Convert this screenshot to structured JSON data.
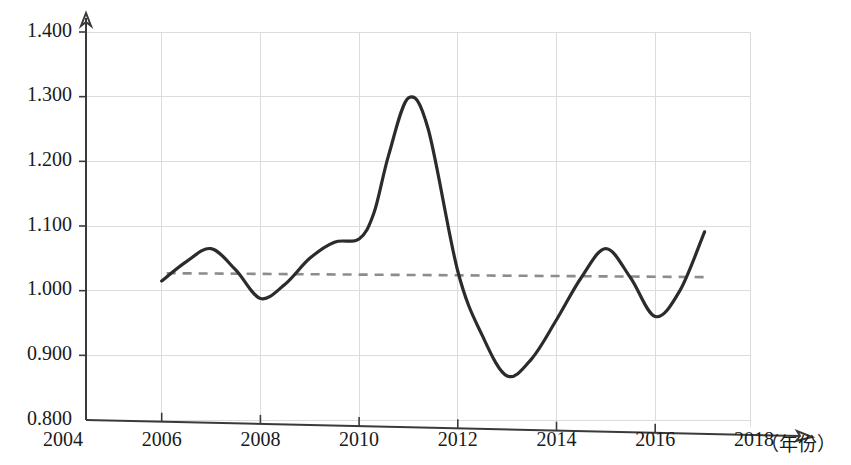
{
  "chart_data": {
    "type": "line",
    "title": "",
    "subtitle": "",
    "xlabel": "（年份）",
    "ylabel": "",
    "xlim": [
      2004,
      2018
    ],
    "ylim": [
      0.8,
      1.4
    ],
    "grid": true,
    "legend": "none",
    "x_tick_labels": [
      "2004",
      "2006",
      "2008",
      "2010",
      "2012",
      "2014",
      "2016",
      "2018"
    ],
    "x_tick_values": [
      2004,
      2006,
      2008,
      2010,
      2012,
      2014,
      2016,
      2018
    ],
    "y_tick_labels": [
      "0.800",
      "0.900",
      "1.000",
      "1.100",
      "1.200",
      "1.300",
      "1.400"
    ],
    "y_tick_values": [
      0.8,
      0.9,
      1.0,
      1.1,
      1.2,
      1.3,
      1.4
    ],
    "series": [
      {
        "name": "指数",
        "style": "solid",
        "color": "#2b2b2b",
        "x": [
          2006,
          2006.5,
          2007,
          2007.5,
          2008,
          2008.5,
          2009,
          2009.5,
          2010,
          2010.3,
          2010.6,
          2011,
          2011.4,
          2012,
          2012.5,
          2013,
          2013.5,
          2014,
          2014.5,
          2015,
          2015.5,
          2016,
          2016.5,
          2017
        ],
        "values": [
          1.015,
          1.045,
          1.065,
          1.032,
          0.988,
          1.01,
          1.05,
          1.075,
          1.08,
          1.12,
          1.21,
          1.298,
          1.25,
          1.03,
          0.93,
          0.868,
          0.895,
          0.955,
          1.02,
          1.065,
          1.02,
          0.96,
          1.0,
          1.091
        ]
      },
      {
        "name": "趋势线",
        "style": "dashed",
        "color": "#8c8c8c",
        "x": [
          2006.1,
          2017.0
        ],
        "values": [
          1.027,
          1.021
        ]
      }
    ],
    "key_points": [
      {
        "year": 2006,
        "value": 1.015,
        "note": "起点"
      },
      {
        "year": 2007,
        "value": 1.065,
        "note": "局部高点"
      },
      {
        "year": 2008,
        "value": 0.988,
        "note": "局部低点"
      },
      {
        "year": 2010,
        "value": 1.08,
        "note": "平台"
      },
      {
        "year": 2011,
        "value": 1.298,
        "note": "最高点"
      },
      {
        "year": 2013,
        "value": 0.868,
        "note": "最低点"
      },
      {
        "year": 2015,
        "value": 1.065,
        "note": "局部高点"
      },
      {
        "year": 2016,
        "value": 0.96,
        "note": "局部低点"
      },
      {
        "year": 2017,
        "value": 1.091,
        "note": "终点"
      }
    ]
  },
  "axes": {
    "x_caption": "（年份）",
    "x_last_tick": "2018"
  },
  "colors": {
    "curve": "#2b2b2b",
    "trend": "#8c8c8c",
    "grid": "#dcdcdc",
    "axis": "#3a3a3a",
    "background": "#ffffff"
  }
}
